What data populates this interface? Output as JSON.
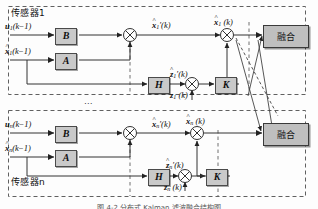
{
  "figure": {
    "type": "block-diagram",
    "caption": "图 4-2 分布式 Kalman 滤波融合结构图"
  },
  "colors": {
    "block_fill": "#c9c9c9",
    "block_border": "#4a4a4a",
    "fusion_fill": "#bfbfbf",
    "line": "#333333",
    "dashed_border": "#555555",
    "background": "#fdfdfd"
  },
  "sensors": [
    {
      "id": "sensor1",
      "group_label": "传感器1",
      "inputs": {
        "control": "u₁(k−1)",
        "state": "x̂₁(k−1)",
        "measurement": "z₁(k)"
      },
      "blocks": {
        "b": "B",
        "a": "A",
        "h": "H",
        "k": "K"
      },
      "signals": {
        "predicted_state": "x̂₁′(k)",
        "predicted_measurement": "ẑ₁′(k)",
        "estimated_state": "x̂₁(k)"
      }
    },
    {
      "id": "sensorN",
      "group_label": "传感器n",
      "inputs": {
        "control": "uₙ(k−1)",
        "state": "x̂ₙ(k−1)",
        "measurement": "zₙ(k)"
      },
      "blocks": {
        "b": "B",
        "a": "A",
        "h": "H",
        "k": "K"
      },
      "signals": {
        "predicted_state": "x̂ₙ′(k)",
        "predicted_measurement": "ẑₙ′(k)",
        "estimated_state": "x̂ₙ(k)"
      }
    }
  ],
  "fusion": {
    "label_top": "融合",
    "label_bottom": "融合"
  },
  "vertical_ellipsis": "⋯",
  "symbols": {
    "summing_junction": "⊕",
    "u1": {
      "base": "u",
      "sub": "1",
      "arg": "(k−1)"
    },
    "un": {
      "base": "u",
      "sub": "n",
      "arg": "(k−1)"
    },
    "x1prev": {
      "base": "x",
      "sub": "1",
      "arg": "(k−1)"
    },
    "xnprev": {
      "base": "x",
      "sub": "n",
      "arg": "(k−1)"
    },
    "x1pred": {
      "base": "x",
      "sub": "1",
      "arg": "′(k)"
    },
    "xnpred": {
      "base": "x",
      "sub": "n",
      "arg": "′(k)"
    },
    "x1est": {
      "base": "x",
      "sub": "1",
      "arg": "(k)"
    },
    "xnest": {
      "base": "x",
      "sub": "n",
      "arg": "(k)"
    },
    "z1pred": {
      "base": "z",
      "sub": "1",
      "arg": "′(k)"
    },
    "znpred": {
      "base": "z",
      "sub": "n",
      "arg": "′(k)"
    },
    "z1meas": {
      "base": "z",
      "sub": "1",
      "arg": "(k)"
    },
    "znmeas": {
      "base": "z",
      "sub": "n",
      "arg": "(k)"
    }
  }
}
